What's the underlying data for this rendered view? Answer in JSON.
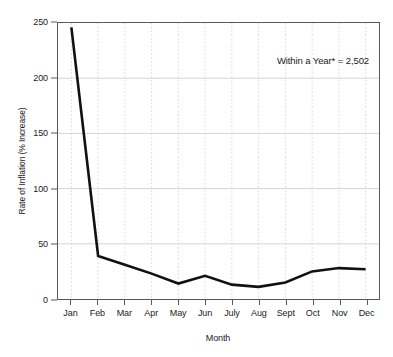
{
  "chart_data": {
    "type": "line",
    "title": "",
    "subtitle": "",
    "xlabel": "Month",
    "ylabel": "Rate of Inflation (% Increase)",
    "categories": [
      "Jan",
      "Feb",
      "Mar",
      "Apr",
      "May",
      "Jun",
      "July",
      "Aug",
      "Sept",
      "Oct",
      "Nov",
      "Dec"
    ],
    "values": [
      246,
      39,
      31,
      23,
      14,
      21,
      13,
      11,
      15,
      25,
      28,
      27
    ],
    "series": [
      {
        "name": "Rate of Inflation",
        "values": [
          246,
          39,
          31,
          23,
          14,
          21,
          13,
          11,
          15,
          25,
          28,
          27
        ]
      }
    ],
    "ylim": [
      0,
      250
    ],
    "yticks": [
      0,
      50,
      100,
      150,
      200,
      250
    ],
    "ytick_labels": [
      "0",
      "50",
      "100",
      "150",
      "200",
      "250"
    ],
    "grid": {
      "horizontal": "solid-light",
      "vertical": "dotted-light"
    },
    "legend": {
      "visible": false,
      "position": "none"
    },
    "annotations": [
      {
        "text": "Within a Year* = 2,502",
        "position": "top-right"
      }
    ],
    "line_color": "#111111",
    "line_width": 2.6,
    "background_color": "#ffffff",
    "axis_color": "#55585c",
    "grid_color": "#d4d4d4"
  }
}
